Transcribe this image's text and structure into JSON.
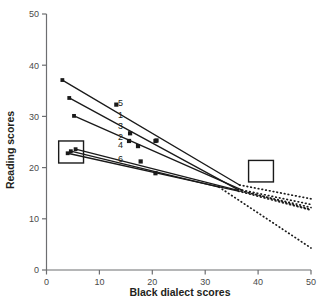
{
  "chart_data": {
    "type": "line",
    "title": "",
    "xlabel": "Black dialect scores",
    "ylabel": "Reading scores",
    "xlim": [
      0,
      50
    ],
    "ylim": [
      0,
      50
    ],
    "xticks": [
      0,
      10,
      20,
      30,
      40,
      50
    ],
    "yticks": [
      0,
      10,
      20,
      30,
      40,
      50
    ],
    "xtick_labels": [
      "0",
      "10",
      "20",
      "30",
      "40",
      "50"
    ],
    "ytick_labels": [
      "0",
      "10",
      "20",
      "30",
      "40",
      "50"
    ],
    "grid": false,
    "legend": "inline-labels",
    "marker": "filled-square",
    "line_color": "#1a1a1a",
    "series": [
      {
        "name": "5",
        "label": "5",
        "label_x": 14.0,
        "label_y": 32.6,
        "solid_x": [
          3.0,
          36.5
        ],
        "solid_y": [
          37.1,
          16.6
        ],
        "dotted_x": [
          36.5,
          50.0
        ],
        "dotted_y": [
          16.6,
          13.9
        ],
        "points_x": [
          13.2,
          20.8
        ],
        "points_y": [
          32.3,
          25.3
        ]
      },
      {
        "name": "1",
        "label": "1",
        "label_x": 14.0,
        "label_y": 30.4,
        "solid_x": [
          4.3,
          36.2
        ],
        "solid_y": [
          33.6,
          15.7
        ],
        "dotted_x": [
          36.2,
          50.0
        ],
        "dotted_y": [
          15.7,
          11.8
        ],
        "points_x": [
          15.8,
          20.6
        ],
        "points_y": [
          26.7,
          25.2
        ]
      },
      {
        "name": "3",
        "label": "3",
        "label_x": 14.0,
        "label_y": 28.1,
        "solid_x": [
          5.2,
          37.0
        ],
        "solid_y": [
          30.1,
          15.6
        ],
        "dotted_x": [
          37.0,
          50.0
        ],
        "dotted_y": [
          15.6,
          12.8
        ],
        "points_x": [
          15.6,
          17.3
        ],
        "points_y": [
          25.2,
          24.2
        ]
      },
      {
        "name": "2",
        "label": "2",
        "label_x": 14.0,
        "label_y": 26.1,
        "solid_x": [
          5.5,
          36.0
        ],
        "solid_y": [
          23.6,
          15.6
        ],
        "dotted_x": [
          36.0,
          50.0
        ],
        "dotted_y": [
          15.6,
          12.2
        ],
        "points_x": [],
        "points_y": []
      },
      {
        "name": "4",
        "label": "4",
        "label_x": 14.0,
        "label_y": 24.4,
        "solid_x": [
          4.0,
          36.3
        ],
        "solid_y": [
          22.8,
          15.4
        ],
        "dotted_x": [
          36.3,
          50.0
        ],
        "dotted_y": [
          15.4,
          11.7
        ],
        "points_x": [
          17.8
        ],
        "points_y": [
          21.2
        ]
      },
      {
        "name": "6",
        "label": "6",
        "label_x": 14.0,
        "label_y": 21.7,
        "solid_x": [
          4.6,
          32.6
        ],
        "solid_y": [
          23.2,
          16.2
        ],
        "dotted_x": [
          32.6,
          50.0
        ],
        "dotted_y": [
          16.2,
          4.3
        ],
        "points_x": [
          20.6
        ],
        "points_y": [
          18.9
        ]
      }
    ],
    "annotation_boxes": [
      {
        "name": "left-box",
        "x0": 2.3,
        "x1": 7.0,
        "y0": 20.9,
        "y1": 25.2
      },
      {
        "name": "right-box",
        "x0": 38.2,
        "x1": 42.9,
        "y0": 17.2,
        "y1": 21.4
      }
    ]
  }
}
